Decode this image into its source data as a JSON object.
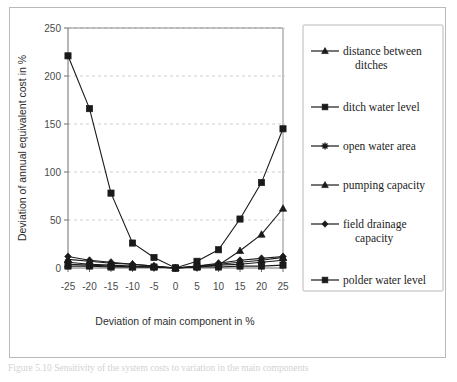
{
  "figure": {
    "caption": "Figure 5.10 Sensitivity of the system costs to variation in the main components"
  },
  "chart_data": {
    "type": "line",
    "title": "",
    "xlabel": "Deviation of main component in %",
    "ylabel": "Deviation of annual equivalent cost in %",
    "categories": [
      "-25",
      "-20",
      "-15",
      "-10",
      "-5",
      "0",
      "5",
      "10",
      "15",
      "20",
      "25"
    ],
    "x": [
      -25,
      -20,
      -15,
      -10,
      -5,
      0,
      5,
      10,
      15,
      20,
      25
    ],
    "xlim": [
      -25,
      25
    ],
    "ylim": [
      0,
      250
    ],
    "yticks": [
      0,
      50,
      100,
      150,
      200,
      250
    ],
    "ytick_labels": [
      "0",
      "50",
      "100",
      "150",
      "200",
      "250"
    ],
    "grid": "horizontal-dashed",
    "legend_position": "right",
    "series": [
      {
        "name": "distance between ditches",
        "marker": "triangle",
        "values": [
          9,
          7,
          5,
          4,
          2,
          0,
          2,
          4,
          6,
          8,
          11
        ]
      },
      {
        "name": "ditch water level",
        "marker": "square",
        "values": [
          221,
          166,
          78,
          26,
          11,
          0,
          7,
          19,
          51,
          89,
          145
        ]
      },
      {
        "name": "open water area",
        "marker": "star",
        "values": [
          6,
          4,
          3,
          2,
          1,
          0,
          1,
          3,
          4,
          6,
          8
        ]
      },
      {
        "name": "pumping capacity",
        "marker": "triangle",
        "values": [
          4,
          3,
          2,
          1,
          1,
          0,
          1,
          3,
          18,
          35,
          62
        ]
      },
      {
        "name": "field drainage capacity",
        "marker": "diamond",
        "values": [
          12,
          8,
          6,
          4,
          2,
          0,
          2,
          5,
          8,
          10,
          12
        ]
      },
      {
        "name": "polder water level",
        "marker": "square",
        "values": [
          2,
          2,
          1,
          1,
          1,
          0,
          1,
          1,
          2,
          2,
          3
        ]
      }
    ]
  },
  "legend": {
    "items": [
      {
        "label_line1": "distance between",
        "label_line2": "ditches",
        "marker": "triangle"
      },
      {
        "label_line1": "ditch water level",
        "label_line2": "",
        "marker": "square"
      },
      {
        "label_line1": "open water area",
        "label_line2": "",
        "marker": "star"
      },
      {
        "label_line1": "pumping capacity",
        "label_line2": "",
        "marker": "triangle"
      },
      {
        "label_line1": "field drainage",
        "label_line2": "capacity",
        "marker": "diamond"
      },
      {
        "label_line1": "polder water level",
        "label_line2": "",
        "marker": "square"
      }
    ]
  },
  "colors": {
    "ink": "#1a1a1a",
    "axis": "#6e6e6e",
    "grid": "#c3c3c3",
    "frame": "#b9b9b9",
    "background": "#ffffff"
  }
}
